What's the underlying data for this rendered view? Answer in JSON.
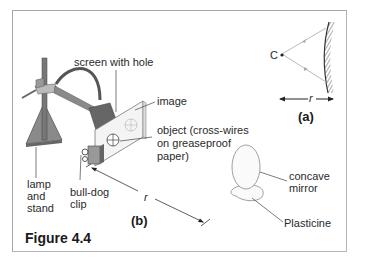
{
  "figure": {
    "title": "Figure 4.4",
    "panel_a": {
      "label": "(a)",
      "centre_label": "C",
      "distance_label": "r"
    },
    "panel_b": {
      "label": "(b)",
      "distance_label": "r",
      "labels": {
        "screen": "screen with hole",
        "image": "image",
        "object_line1": "object (cross-wires",
        "object_line2": "on greaseproof",
        "object_line3": "paper)",
        "lamp_line1": "lamp",
        "lamp_line2": "and",
        "lamp_line3": "stand",
        "clip_line1": "bull-dog",
        "clip_line2": "clip",
        "mirror_line1": "concave",
        "mirror_line2": "mirror",
        "plasticine": "Plasticine"
      }
    }
  }
}
